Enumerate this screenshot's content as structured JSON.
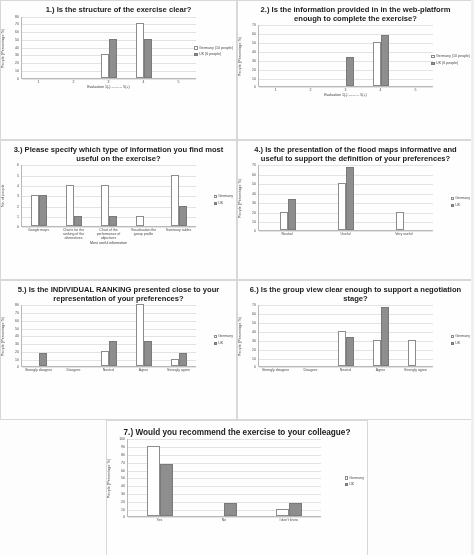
{
  "legend": {
    "germany_label": "Germany (10 people)",
    "uk_label": "UK (6 people)",
    "germany_label_short": "Germany",
    "uk_label_short": "UK"
  },
  "charts": [
    {
      "number": "1.)",
      "title": "1.) Is the structure of the exercise clear?",
      "ylabel": "People (Percentage %)",
      "xlabel": "Evaluation 1(-) ——→ 5(+)",
      "yticks": [
        "80",
        "70",
        "60",
        "50",
        "40",
        "30",
        "20",
        "10",
        "0"
      ],
      "ymax": 80,
      "categories": [
        "1",
        "2",
        "3",
        "4",
        "5"
      ],
      "germany": [
        0,
        0,
        30,
        70,
        0
      ],
      "uk": [
        0,
        0,
        50,
        50,
        0
      ],
      "legend_germany": "Germany (10 people)",
      "legend_uk": "UK (6 people)"
    },
    {
      "number": "2.)",
      "title": "2.) Is the information provided in in the web-platform enough to complete the exercise?",
      "ylabel": "People (Percentage %)",
      "xlabel": "Evaluation 1(-) ——→ 5(+)",
      "yticks": [
        "70",
        "60",
        "50",
        "40",
        "30",
        "20",
        "10",
        "0"
      ],
      "ymax": 70,
      "categories": [
        "1",
        "2",
        "3",
        "4",
        "5"
      ],
      "germany": [
        0,
        0,
        0,
        50,
        0
      ],
      "uk": [
        0,
        0,
        33,
        58,
        0
      ],
      "legend_germany": "Germany (10 people)",
      "legend_uk": "UK (6 people)"
    },
    {
      "number": "3.)",
      "title": "3.) Please specify which type of information you find most useful on the exercise?",
      "ylabel": "No. of people",
      "xlabel": "Most useful information",
      "yticks": [
        "6",
        "5",
        "4",
        "3",
        "2",
        "1",
        "0"
      ],
      "ymax": 6,
      "categories": [
        "Google maps",
        "Charts for the ranking of the alternatives",
        "Chart of the performance of objectives",
        "Visualisation the group profile",
        "Summary tables"
      ],
      "germany": [
        3,
        4,
        4,
        1,
        5
      ],
      "uk": [
        3,
        1,
        1,
        0,
        2
      ],
      "legend_germany": "Germany",
      "legend_uk": "UK"
    },
    {
      "number": "4.)",
      "title": "4.) Is the presentation of the flood maps informative and useful to support the definition of your preferences?",
      "ylabel": "People (Percentage %)",
      "xlabel": "",
      "yticks": [
        "70",
        "60",
        "50",
        "40",
        "30",
        "20",
        "10",
        "0"
      ],
      "ymax": 70,
      "categories": [
        "Neutral",
        "Useful",
        "Very useful"
      ],
      "germany": [
        20,
        50,
        20
      ],
      "uk": [
        33,
        67,
        0
      ],
      "legend_germany": "Germany",
      "legend_uk": "UK"
    },
    {
      "number": "5.)",
      "title": "5.) Is the INDIVIDUAL RANKING presented close to your representation of your preferences?",
      "ylabel": "People (Percentage %)",
      "xlabel": "",
      "yticks": [
        "80",
        "70",
        "60",
        "50",
        "40",
        "30",
        "20",
        "10",
        "0"
      ],
      "ymax": 80,
      "categories": [
        "Strongly disagree",
        "Disagree",
        "Neutral",
        "Agree",
        "Strongly agree"
      ],
      "germany": [
        0,
        0,
        20,
        80,
        10
      ],
      "uk": [
        17,
        0,
        33,
        33,
        17
      ],
      "legend_germany": "Germany",
      "legend_uk": "UK"
    },
    {
      "number": "6.)",
      "title": "6.) Is the group view clear enough to support a negotiation stage?",
      "ylabel": "People (Percentage %)",
      "xlabel": "",
      "yticks": [
        "70",
        "60",
        "50",
        "40",
        "30",
        "20",
        "10",
        "0"
      ],
      "ymax": 70,
      "categories": [
        "Strongly disagree",
        "Disagree",
        "Neutral",
        "Agree",
        "Strongly agree"
      ],
      "germany": [
        0,
        0,
        40,
        30,
        30
      ],
      "uk": [
        0,
        0,
        33,
        67,
        0
      ],
      "legend_germany": "Germany",
      "legend_uk": "UK"
    },
    {
      "number": "7.)",
      "title": "7.) Would you recommend the exercise to your colleague?",
      "ylabel": "People (Percentage %)",
      "xlabel": "",
      "yticks": [
        "100",
        "90",
        "80",
        "70",
        "60",
        "50",
        "40",
        "30",
        "20",
        "10",
        "0"
      ],
      "ymax": 100,
      "categories": [
        "Yes",
        "No",
        "I don't know"
      ],
      "germany": [
        90,
        0,
        10
      ],
      "uk": [
        67,
        17,
        17
      ],
      "legend_germany": "Germany",
      "legend_uk": "UK"
    }
  ],
  "chart_data": [
    {
      "type": "bar",
      "title": "1.) Is the structure of the exercise clear?",
      "xlabel": "Evaluation 1(-) ----> 5(+)",
      "ylabel": "People (Percentage %)",
      "categories": [
        "1",
        "2",
        "3",
        "4",
        "5"
      ],
      "series": [
        {
          "name": "Germany (10 people)",
          "values": [
            0,
            0,
            30,
            70,
            0
          ]
        },
        {
          "name": "UK (6 people)",
          "values": [
            0,
            0,
            50,
            50,
            0
          ]
        }
      ],
      "ylim": [
        0,
        80
      ],
      "grid": true,
      "legend_position": "right"
    },
    {
      "type": "bar",
      "title": "2.) Is the information provided in in the web-platform enough to complete the exercise?",
      "xlabel": "Evaluation 1(-) ----> 5(+)",
      "ylabel": "People (Percentage %)",
      "categories": [
        "1",
        "2",
        "3",
        "4",
        "5"
      ],
      "series": [
        {
          "name": "Germany (10 people)",
          "values": [
            0,
            0,
            0,
            50,
            0
          ]
        },
        {
          "name": "UK (6 people)",
          "values": [
            0,
            0,
            33,
            58,
            0
          ]
        }
      ],
      "ylim": [
        0,
        70
      ],
      "grid": true,
      "legend_position": "right"
    },
    {
      "type": "bar",
      "title": "3.) Please specify which type of information you find most useful on the exercise?",
      "xlabel": "Most useful information",
      "ylabel": "No. of people",
      "categories": [
        "Google maps",
        "Charts for the ranking of the alternatives",
        "Chart of the performance of objectives",
        "Visualisation the group profile",
        "Summary tables"
      ],
      "series": [
        {
          "name": "Germany",
          "values": [
            3,
            4,
            4,
            1,
            5
          ]
        },
        {
          "name": "UK",
          "values": [
            3,
            1,
            1,
            0,
            2
          ]
        }
      ],
      "ylim": [
        0,
        6
      ],
      "grid": true,
      "legend_position": "right"
    },
    {
      "type": "bar",
      "title": "4.) Is the presentation of the flood maps informative and useful to support the definition of your preferences?",
      "xlabel": "",
      "ylabel": "People (Percentage %)",
      "categories": [
        "Neutral",
        "Useful",
        "Very useful"
      ],
      "series": [
        {
          "name": "Germany",
          "values": [
            20,
            50,
            20
          ]
        },
        {
          "name": "UK",
          "values": [
            33,
            67,
            0
          ]
        }
      ],
      "ylim": [
        0,
        70
      ],
      "grid": true,
      "legend_position": "right"
    },
    {
      "type": "bar",
      "title": "5.) Is the INDIVIDUAL RANKING presented close to your representation of your preferences?",
      "xlabel": "",
      "ylabel": "People (Percentage %)",
      "categories": [
        "Strongly disagree",
        "Disagree",
        "Neutral",
        "Agree",
        "Strongly agree"
      ],
      "series": [
        {
          "name": "Germany",
          "values": [
            0,
            0,
            20,
            80,
            10
          ]
        },
        {
          "name": "UK",
          "values": [
            17,
            0,
            33,
            33,
            17
          ]
        }
      ],
      "ylim": [
        0,
        80
      ],
      "grid": true,
      "legend_position": "right"
    },
    {
      "type": "bar",
      "title": "6.) Is the group view clear enough to support a negotiation stage?",
      "xlabel": "",
      "ylabel": "People (Percentage %)",
      "categories": [
        "Strongly disagree",
        "Disagree",
        "Neutral",
        "Agree",
        "Strongly agree"
      ],
      "series": [
        {
          "name": "Germany",
          "values": [
            0,
            0,
            40,
            30,
            30
          ]
        },
        {
          "name": "UK",
          "values": [
            0,
            0,
            33,
            67,
            0
          ]
        }
      ],
      "ylim": [
        0,
        70
      ],
      "grid": true,
      "legend_position": "right"
    },
    {
      "type": "bar",
      "title": "7.) Would you recommend the exercise to your colleague?",
      "xlabel": "",
      "ylabel": "People (Percentage %)",
      "categories": [
        "Yes",
        "No",
        "I don't know"
      ],
      "series": [
        {
          "name": "Germany",
          "values": [
            90,
            0,
            10
          ]
        },
        {
          "name": "UK",
          "values": [
            67,
            17,
            17
          ]
        }
      ],
      "ylim": [
        0,
        100
      ],
      "grid": true,
      "legend_position": "right"
    }
  ]
}
